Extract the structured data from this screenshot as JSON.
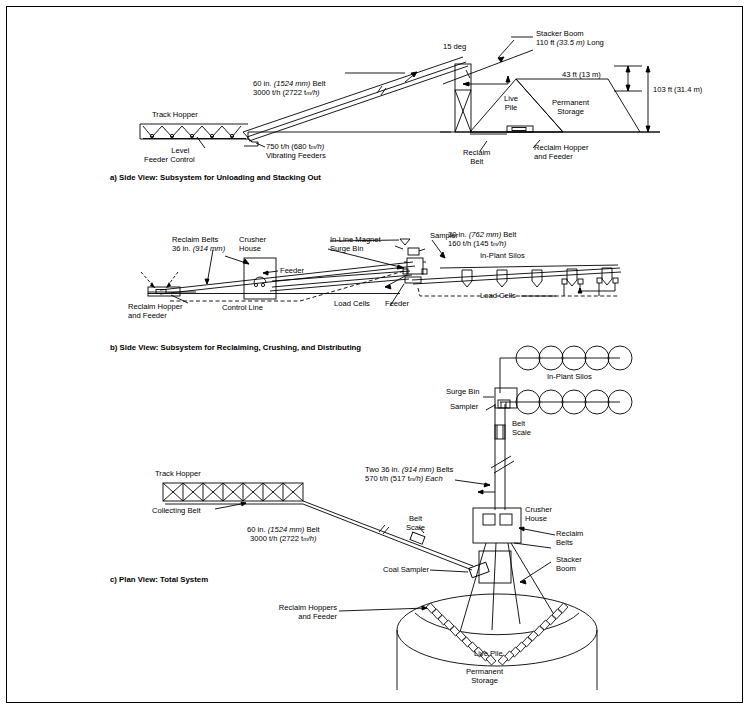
{
  "document": {
    "type": "engineering-diagram",
    "title": "Coal Handling System Diagrams"
  },
  "captions": {
    "a": "a) Side View: Subsystem for Unloading and Stacking Out",
    "b": "b) Side View: Subsystem for Reclaiming, Crushing, and Distributing",
    "c": "c) Plan View: Total System"
  },
  "diagram_a": {
    "labels": {
      "track_hopper": "Track Hopper",
      "level_feeder_control_l1": "Level",
      "level_feeder_control_l2": "Feeder Control",
      "vibrating_feeders_l1": "750 t/h (680 t",
      "vibrating_feeders_l1_sub": "m",
      "vibrating_feeders_l1_end": "/h)",
      "vibrating_feeders_l2": "Vibrating Feeders",
      "belt_l1": "60 in. (1524 mm) Belt",
      "belt_l2_a": "3000 t/h (2722 t",
      "belt_l2_sub": "m",
      "belt_l2_b": "/h)",
      "angle": "15 deg",
      "stacker_boom_l1": "Stacker Boom",
      "stacker_boom_l2": "110 ft (33.5 m) Long",
      "live_pile_l1": "Live",
      "live_pile_l2": "Pile",
      "permanent_storage_l1": "Permanent",
      "permanent_storage_l2": "Storage",
      "dim_43": "43 ft (13 m)",
      "dim_103": "103 ft (31.4 m)",
      "reclaim_belt_l1": "Reclaim",
      "reclaim_belt_l2": "Belt",
      "reclaim_hopper_l1": "Reclaim Hopper",
      "reclaim_hopper_l2": "and Feeder"
    }
  },
  "diagram_b": {
    "labels": {
      "reclaim_belts_l1": "Reclaim Belts",
      "reclaim_belts_l2": "36 in. (914 mm)",
      "crusher_house_l1": "Crusher",
      "crusher_house_l2": "House",
      "feeder_left": "Feeder",
      "reclaim_hopper_l1": "Reclaim Hopper",
      "reclaim_hopper_l2": "and Feeder",
      "control_line": "Control Line",
      "in_line_magnet": "In-Line Magnet",
      "sampler": "Sampler",
      "surge_bin": "Surge Bin",
      "load_cells_left": "Load Cells",
      "feeder_right": "Feeder",
      "belt_l1": "30 in. (762 mm) Belt",
      "belt_l2_a": "160 t/h (145 t",
      "belt_l2_sub": "m",
      "belt_l2_b": "/h)",
      "in_plant_silos": "In-Plant Silos",
      "load_cells_right": "Load Cells"
    }
  },
  "diagram_c": {
    "labels": {
      "track_hopper": "Track Hopper",
      "collecting_belt": "Collecting Belt",
      "belt_l1": "60 in. (1524 mm) Belt",
      "belt_l2_a": "3000 t/h (2722 t",
      "belt_l2_sub": "m",
      "belt_l2_b": "/h)",
      "belt_scale_l1": "Belt",
      "belt_scale_l2": "Scale",
      "two_belts_l1": "Two 36 in. (914 mm) Belts",
      "two_belts_l2_a": "570 t/h (517 t",
      "two_belts_l2_sub": "m",
      "two_belts_l2_b": "/h) Each",
      "in_plant_silos": "In-Plant Silos",
      "surge_bin": "Surge Bin",
      "sampler": "Sampler",
      "belt_scale2_l1": "Belt",
      "belt_scale2_l2": "Scale",
      "crusher_house_l1": "Crusher",
      "crusher_house_l2": "House",
      "reclaim_belts_l1": "Reclaim",
      "reclaim_belts_l2": "Belts",
      "coal_sampler": "Coal Sampler",
      "stacker_boom_l1": "Stacker",
      "stacker_boom_l2": "Boom",
      "reclaim_hoppers_l1": "Reclaim Hoppers",
      "reclaim_hoppers_l2": "and Feeder",
      "live_pile": "Live Pile",
      "permanent_storage_l1": "Permanent",
      "permanent_storage_l2": "Storage"
    }
  },
  "colors": {
    "stroke": "#000000",
    "background": "#ffffff",
    "border": "#000000"
  }
}
